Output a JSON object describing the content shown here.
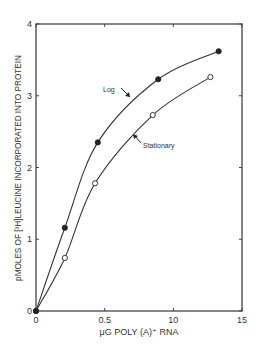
{
  "chart_data": {
    "type": "line",
    "title": "",
    "xlabel": "μG POLY (A)⁺ RNA",
    "ylabel": "pMOLES OF [³H]LEUCINE INCORPORATED INTO PROTEIN",
    "xlim": [
      0,
      15
    ],
    "ylim": [
      0,
      4
    ],
    "x_ticks": [
      0,
      5,
      10,
      15
    ],
    "x_tick_labels": [
      "0",
      "0.5",
      "10",
      "15"
    ],
    "y_ticks": [
      0,
      1,
      2,
      3,
      4
    ],
    "y_tick_labels": [
      "0",
      "1",
      "2",
      "3",
      "4"
    ],
    "grid": false,
    "legend": "inline annotations",
    "series": [
      {
        "name": "Log",
        "marker": "filled-circle",
        "x": [
          0,
          2.1,
          4.5,
          8.9,
          13.3
        ],
        "y": [
          0,
          1.16,
          2.35,
          3.23,
          3.62
        ]
      },
      {
        "name": "Stationary",
        "marker": "open-circle",
        "x": [
          0,
          2.1,
          4.3,
          8.5,
          12.7
        ],
        "y": [
          0,
          0.74,
          1.78,
          2.73,
          3.26
        ]
      }
    ],
    "annotations": [
      {
        "text": "Log",
        "points_to": "Log"
      },
      {
        "text": "Stationary",
        "points_to": "Stationary"
      }
    ]
  },
  "colors": {
    "line": "#333333",
    "axis": "#444444",
    "background": "#ffffff"
  }
}
